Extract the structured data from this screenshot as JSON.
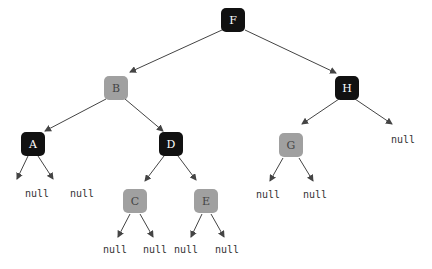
{
  "diagram": {
    "type": "binary-tree",
    "colors": {
      "dark_node": "#111111",
      "gray_node": "#a0a0a0",
      "dark_text": "#ffffff",
      "gray_text": "#444444",
      "edge": "#444444"
    },
    "nodes": [
      {
        "id": "F",
        "label": "F",
        "style": "dark",
        "x": 233,
        "y": 20
      },
      {
        "id": "B",
        "label": "B",
        "style": "gray",
        "x": 116,
        "y": 88
      },
      {
        "id": "H",
        "label": "H",
        "style": "dark",
        "x": 347,
        "y": 88
      },
      {
        "id": "A",
        "label": "A",
        "style": "dark",
        "x": 33,
        "y": 144
      },
      {
        "id": "D",
        "label": "D",
        "style": "dark",
        "x": 171,
        "y": 144
      },
      {
        "id": "G",
        "label": "G",
        "style": "gray",
        "x": 291,
        "y": 145
      },
      {
        "id": "C",
        "label": "C",
        "style": "gray",
        "x": 135,
        "y": 201
      },
      {
        "id": "E",
        "label": "E",
        "style": "gray",
        "x": 206,
        "y": 201
      }
    ],
    "nulls": [
      {
        "id": "A-left",
        "label": "null",
        "x": 37,
        "y": 197
      },
      {
        "id": "A-right",
        "label": "null",
        "x": 82,
        "y": 197
      },
      {
        "id": "H-right",
        "label": "null",
        "x": 403,
        "y": 143
      },
      {
        "id": "G-left",
        "label": "null",
        "x": 268,
        "y": 198
      },
      {
        "id": "G-right",
        "label": "null",
        "x": 315,
        "y": 198
      },
      {
        "id": "C-left",
        "label": "null",
        "x": 115,
        "y": 253
      },
      {
        "id": "C-right",
        "label": "null",
        "x": 155,
        "y": 253
      },
      {
        "id": "E-left",
        "label": "null",
        "x": 186,
        "y": 253
      },
      {
        "id": "E-right",
        "label": "null",
        "x": 227,
        "y": 253
      }
    ],
    "edges": [
      {
        "from": [
          222,
          30
        ],
        "to": [
          130,
          72
        ]
      },
      {
        "from": [
          245,
          30
        ],
        "to": [
          336,
          73
        ]
      },
      {
        "from": [
          106,
          99
        ],
        "to": [
          45,
          131
        ]
      },
      {
        "from": [
          125,
          99
        ],
        "to": [
          163,
          131
        ]
      },
      {
        "from": [
          339,
          99
        ],
        "to": [
          302,
          124
        ]
      },
      {
        "from": [
          355,
          99
        ],
        "to": [
          392,
          124
        ]
      },
      {
        "from": [
          28,
          156
        ],
        "to": [
          17,
          179
        ]
      },
      {
        "from": [
          38,
          156
        ],
        "to": [
          53,
          179
        ]
      },
      {
        "from": [
          164,
          156
        ],
        "to": [
          145,
          181
        ]
      },
      {
        "from": [
          178,
          156
        ],
        "to": [
          196,
          180
        ]
      },
      {
        "from": [
          283,
          158
        ],
        "to": [
          270,
          181
        ]
      },
      {
        "from": [
          299,
          158
        ],
        "to": [
          313,
          181
        ]
      },
      {
        "from": [
          130,
          214
        ],
        "to": [
          118,
          237
        ]
      },
      {
        "from": [
          140,
          214
        ],
        "to": [
          153,
          237
        ]
      },
      {
        "from": [
          202,
          214
        ],
        "to": [
          191,
          237
        ]
      },
      {
        "from": [
          211,
          214
        ],
        "to": [
          224,
          237
        ]
      }
    ]
  }
}
